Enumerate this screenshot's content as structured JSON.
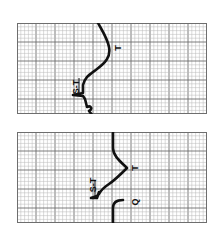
{
  "figure": {
    "grid_color_minor": "#b8b8b8",
    "grid_color_major": "#6e6e6e",
    "trace_color": "#111111",
    "strips": [
      {
        "id": "top",
        "labels": {
          "st": "S-T",
          "t": "T"
        }
      },
      {
        "id": "bottom",
        "labels": {
          "st": "S-T",
          "t": "T",
          "q": "Q"
        }
      }
    ]
  }
}
